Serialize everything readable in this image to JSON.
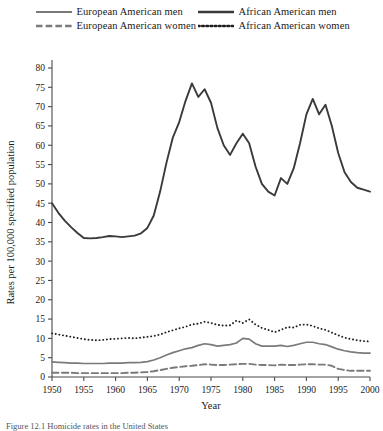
{
  "figure": {
    "caption": "Figure 12.1 Homicide rates in the United States",
    "background": "#ffffff"
  },
  "legend": {
    "position": "top",
    "rows": [
      [
        {
          "label": "European American men",
          "style": "solid",
          "color": "#7a7a7a",
          "icon": "line-solid-icon"
        },
        {
          "label": "African American men",
          "style": "solid",
          "color": "#3a3a3a",
          "icon": "line-solid-icon"
        }
      ],
      [
        {
          "label": "European American women",
          "style": "dashed",
          "color": "#7a7a7a",
          "icon": "line-dashed-icon"
        },
        {
          "label": "African American women",
          "style": "dotted",
          "color": "#1f1f1f",
          "icon": "line-dotted-icon"
        }
      ]
    ]
  },
  "chart_data": {
    "type": "line",
    "title": "",
    "xlabel": "Year",
    "ylabel": "Rates per 100,000 specified population",
    "xlim": [
      1950,
      2000
    ],
    "ylim": [
      0,
      80
    ],
    "xticks": [
      1950,
      1955,
      1960,
      1965,
      1970,
      1975,
      1980,
      1985,
      1990,
      1995,
      2000
    ],
    "yticks": [
      0,
      5,
      10,
      15,
      20,
      25,
      30,
      35,
      40,
      45,
      50,
      55,
      60,
      65,
      70,
      75,
      80
    ],
    "grid": false,
    "legend_position": "above-plot",
    "x": [
      1950,
      1951,
      1952,
      1953,
      1954,
      1955,
      1956,
      1957,
      1958,
      1959,
      1960,
      1961,
      1962,
      1963,
      1964,
      1965,
      1966,
      1967,
      1968,
      1969,
      1970,
      1971,
      1972,
      1973,
      1974,
      1975,
      1976,
      1977,
      1978,
      1979,
      1980,
      1981,
      1982,
      1983,
      1984,
      1985,
      1986,
      1987,
      1988,
      1989,
      1990,
      1991,
      1992,
      1993,
      1994,
      1995,
      1996,
      1997,
      1998,
      1999,
      2000
    ],
    "series": [
      {
        "name": "African American men",
        "style": "solid",
        "color": "#3a3a3a",
        "width": 1.9,
        "values": [
          45.0,
          42.5,
          40.5,
          38.8,
          37.3,
          36.0,
          35.9,
          36.0,
          36.2,
          36.5,
          36.4,
          36.2,
          36.4,
          36.6,
          37.2,
          38.6,
          41.8,
          48.0,
          55.5,
          62.0,
          66.0,
          71.5,
          76.0,
          72.5,
          74.5,
          71.0,
          64.5,
          60.0,
          57.5,
          60.5,
          63.0,
          60.5,
          54.5,
          50.0,
          48.0,
          47.0,
          51.5,
          50.0,
          54.0,
          60.5,
          68.0,
          72.0,
          68.0,
          70.5,
          65.0,
          58.0,
          53.0,
          50.5,
          49.0,
          48.5,
          48.0
        ]
      },
      {
        "name": "African American women",
        "style": "dotted",
        "color": "#1f1f1f",
        "width": 1.9,
        "values": [
          11.3,
          11.0,
          10.7,
          10.4,
          10.1,
          9.8,
          9.6,
          9.5,
          9.6,
          9.8,
          9.9,
          10.0,
          10.1,
          10.0,
          10.2,
          10.4,
          10.6,
          11.0,
          11.6,
          12.1,
          12.6,
          13.0,
          13.6,
          13.8,
          14.3,
          14.0,
          13.5,
          13.3,
          13.4,
          14.6,
          14.0,
          14.9,
          13.6,
          12.7,
          12.2,
          11.6,
          12.2,
          12.9,
          12.8,
          13.5,
          13.6,
          13.2,
          12.6,
          12.2,
          11.5,
          10.8,
          10.2,
          9.8,
          9.5,
          9.3,
          9.2
        ]
      },
      {
        "name": "European American men",
        "style": "solid",
        "color": "#7a7a7a",
        "width": 1.7,
        "values": [
          3.9,
          3.8,
          3.7,
          3.6,
          3.6,
          3.5,
          3.5,
          3.5,
          3.5,
          3.6,
          3.6,
          3.6,
          3.7,
          3.7,
          3.8,
          4.0,
          4.4,
          5.0,
          5.7,
          6.3,
          6.8,
          7.3,
          7.6,
          8.2,
          8.6,
          8.4,
          8.0,
          8.2,
          8.4,
          8.8,
          10.0,
          9.8,
          8.6,
          8.0,
          8.0,
          8.0,
          8.2,
          7.9,
          8.2,
          8.6,
          9.0,
          9.0,
          8.6,
          8.4,
          7.8,
          7.2,
          6.8,
          6.5,
          6.3,
          6.2,
          6.2
        ]
      },
      {
        "name": "European American women",
        "style": "dashed",
        "color": "#7a7a7a",
        "width": 1.9,
        "values": [
          1.1,
          1.1,
          1.1,
          1.1,
          1.0,
          1.0,
          1.0,
          1.0,
          1.0,
          1.0,
          1.0,
          1.0,
          1.1,
          1.1,
          1.2,
          1.3,
          1.5,
          1.8,
          2.1,
          2.4,
          2.6,
          2.8,
          2.9,
          3.1,
          3.3,
          3.2,
          3.1,
          3.1,
          3.2,
          3.3,
          3.4,
          3.4,
          3.2,
          3.1,
          3.1,
          3.0,
          3.2,
          3.1,
          3.1,
          3.2,
          3.3,
          3.3,
          3.2,
          3.2,
          2.9,
          2.1,
          1.8,
          1.6,
          1.6,
          1.6,
          1.6
        ]
      }
    ]
  }
}
